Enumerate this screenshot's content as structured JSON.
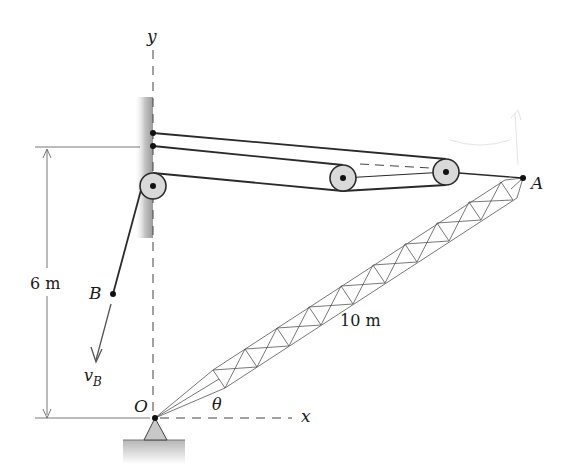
{
  "figure": {
    "type": "mechanics-diagram",
    "labels": {
      "y_axis": "y",
      "x_axis": "x",
      "point_A": "A",
      "point_B": "B",
      "point_O": "O",
      "angle": "θ",
      "velocity_main": "v",
      "velocity_sub": "B",
      "height_dim": "6 m",
      "boom_length": "10 m"
    },
    "dimensions": {
      "wall_pulley_height_m": 6,
      "boom_length_m": 10
    },
    "colors": {
      "line": "#2a2a2a",
      "pulley_fill": "#d9d9d9",
      "wall_shade": "#a8a8a8",
      "ground_shade": "#bdbdbd"
    }
  }
}
